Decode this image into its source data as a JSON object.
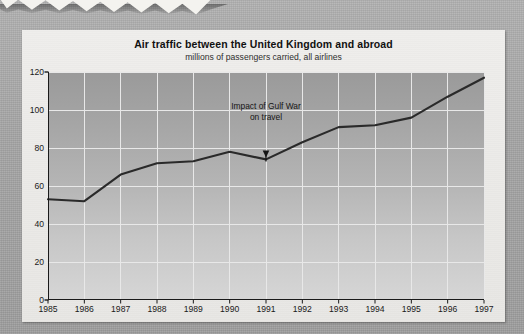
{
  "scrap": {
    "text": "February 1999"
  },
  "card": {
    "title": "Air traffic between the United Kingdom and abroad",
    "subtitle": "millions of passengers carried, all airlines"
  },
  "annotation": {
    "line1": "Impact of Gulf War",
    "line2": "on travel",
    "target_year": "1991"
  },
  "colors": {
    "page_background": "#a9a9a9",
    "card_background": "#ececec",
    "plot_top": "#9a9a9a",
    "plot_bottom": "#d6d6d6",
    "gridline": "#e8e8e8",
    "axis": "#1a1a1a",
    "series_line": "#2a2a2a",
    "text": "#111111"
  },
  "chart_data": {
    "type": "line",
    "title": "Air traffic between the United Kingdom and abroad",
    "subtitle": "millions of passengers carried, all airlines",
    "xlabel": "",
    "ylabel": "millions of passengers carried, all airlines",
    "x": [
      1985,
      1986,
      1987,
      1988,
      1989,
      1990,
      1991,
      1992,
      1993,
      1994,
      1995,
      1996,
      1997
    ],
    "xtick_labels": [
      "1985",
      "1986",
      "1987",
      "1988",
      "1989",
      "1990",
      "1991",
      "1992",
      "1993",
      "1994",
      "1995",
      "1996",
      "1997"
    ],
    "values": [
      53,
      52,
      66,
      72,
      73,
      78,
      74,
      83,
      91,
      92,
      96,
      107,
      117
    ],
    "ytick_labels": [
      "0",
      "20",
      "40",
      "60",
      "80",
      "100",
      "120"
    ],
    "yticks": [
      0,
      20,
      40,
      60,
      80,
      100,
      120
    ],
    "ylim": [
      0,
      120
    ],
    "xlim": [
      1985,
      1997
    ],
    "grid": true,
    "legend": false,
    "annotations": [
      {
        "text": "Impact of Gulf War on travel",
        "x": 1991,
        "y": 74,
        "arrow": "down"
      }
    ]
  }
}
